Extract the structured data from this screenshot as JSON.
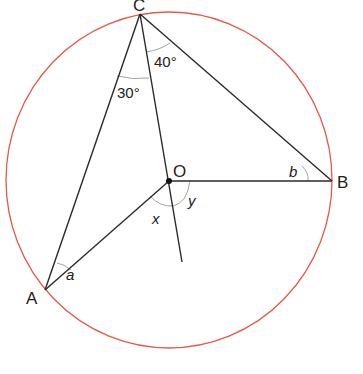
{
  "diagram": {
    "colors": {
      "circle": "#e8584a",
      "lines": "#2a2a2a",
      "arcs": "#9a9a9a",
      "text": "#222222"
    },
    "circle": {
      "cx": 169,
      "cy": 180,
      "rx": 163,
      "ry": 168
    },
    "points": {
      "A": {
        "label": "A",
        "x": 45,
        "y": 290
      },
      "B": {
        "label": "B",
        "x": 332,
        "y": 181
      },
      "C": {
        "label": "C",
        "x": 140,
        "y": 13
      },
      "O": {
        "label": "O",
        "x": 169,
        "y": 181
      }
    },
    "segments": [
      {
        "from": "C",
        "to": "A"
      },
      {
        "from": "C",
        "to": "B"
      },
      {
        "from": "O",
        "to": "B"
      },
      {
        "from": "O",
        "to": "A"
      },
      {
        "from": "C",
        "to": "extension",
        "end": {
          "x": 182,
          "y": 262
        }
      }
    ],
    "angle_labels": {
      "angle_ACO": "30°",
      "angle_OCB": "40°",
      "a": "a",
      "b": "b",
      "x": "x",
      "y": "y"
    }
  }
}
